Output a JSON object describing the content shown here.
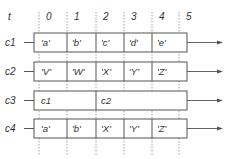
{
  "diagram": {
    "time_axis_label": "t",
    "time_ticks": [
      "0",
      "1",
      "2",
      "3",
      "4",
      "5"
    ],
    "channels": [
      {
        "name": "c1",
        "cells": [
          "'a'",
          "'b'",
          "'c'",
          "'d'",
          "'e'"
        ],
        "spans": [
          1,
          1,
          1,
          1,
          1
        ]
      },
      {
        "name": "c2",
        "cells": [
          "'V'",
          "'W'",
          "'X'",
          "'Y'",
          "'Z'"
        ],
        "spans": [
          1,
          1,
          1,
          1,
          1
        ]
      },
      {
        "name": "c3",
        "cells": [
          "c1",
          "c2"
        ],
        "spans": [
          2,
          3
        ]
      },
      {
        "name": "c4",
        "cells": [
          "'a'",
          "'b'",
          "'X'",
          "'Y'",
          "'Z'"
        ],
        "spans": [
          1,
          1,
          1,
          1,
          1
        ]
      }
    ],
    "colors": {
      "line": "#555555",
      "text": "#333333",
      "grid": "#888888"
    }
  }
}
